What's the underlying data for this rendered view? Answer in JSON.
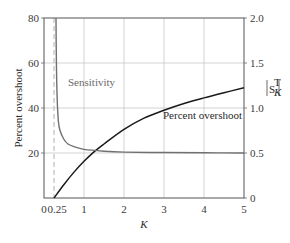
{
  "chart_data": {
    "type": "line",
    "title": "",
    "xlabel": "K",
    "ylabel": "Percent overshoot",
    "y2label": "|S_K^T|",
    "xlim": [
      0,
      5
    ],
    "ylim": [
      0,
      80
    ],
    "y2lim": [
      0,
      2.0
    ],
    "grid": true,
    "x_ticks": [
      "0",
      "0.25",
      "1",
      "2",
      "3",
      "4",
      "5"
    ],
    "y_ticks": [
      "20",
      "40",
      "60",
      "80"
    ],
    "y2_ticks": [
      "0",
      "0.5",
      "1.0",
      "1.5",
      "2.0"
    ],
    "annotations": [
      {
        "text": "Sensitivity",
        "x": 0.7,
        "y": 58
      },
      {
        "text": "Percent overshoot",
        "x": 2.85,
        "y": 33
      },
      {
        "text": "dashed reference line at K = 0.25"
      }
    ],
    "series": [
      {
        "name": "Percent overshoot",
        "axis": "left",
        "color": "#1a1a1a",
        "x": [
          0.25,
          0.5,
          0.75,
          1.0,
          1.25,
          1.5,
          2.0,
          2.5,
          3.0,
          3.5,
          4.0,
          4.5,
          5.0
        ],
        "values": [
          0,
          6,
          11.5,
          16.3,
          20.5,
          24,
          30.5,
          35.5,
          39,
          42,
          44.5,
          46.8,
          49
        ]
      },
      {
        "name": "Sensitivity",
        "axis": "right",
        "color": "#707070",
        "x": [
          0.3,
          0.31,
          0.33,
          0.36,
          0.4,
          0.5,
          0.6,
          0.75,
          1.0,
          1.5,
          2.0,
          3.0,
          4.0,
          5.0
        ],
        "values": [
          2.0,
          1.5,
          1.1,
          0.85,
          0.75,
          0.65,
          0.6,
          0.57,
          0.54,
          0.52,
          0.51,
          0.505,
          0.502,
          0.5
        ]
      }
    ]
  },
  "labels": {
    "ylabel": "Percent overshoot",
    "xlabel": "K",
    "sensitivity_annotation": "Sensitivity",
    "overshoot_annotation": "Percent overshoot",
    "y2label_main": "S",
    "y2label_sup": "T",
    "y2label_sub": "K"
  }
}
